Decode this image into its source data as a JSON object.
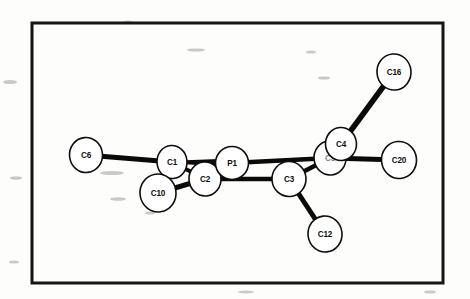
{
  "figure": {
    "kind": "molecular-structure-diagram",
    "style": "ORTEP crystal structure plot",
    "background_color": "#fdfdfc",
    "ink_color": "#0a0a0a",
    "atom_fill_color": "#ffffff",
    "frame": {
      "x": 32,
      "y": 23,
      "width": 411,
      "height": 260,
      "stroke_width": 3
    },
    "atoms": [
      {
        "id": "C6",
        "label": "C6",
        "cx": 86,
        "cy": 155,
        "rx": 16.5,
        "ry": 17.5,
        "rot": -6,
        "obscured": false
      },
      {
        "id": "C1",
        "label": "C1",
        "cx": 172,
        "cy": 162,
        "rx": 15.0,
        "ry": 16.5,
        "rot": -4,
        "obscured": false
      },
      {
        "id": "C10",
        "label": "C10",
        "cx": 158,
        "cy": 193,
        "rx": 18.0,
        "ry": 19.0,
        "rot": -8,
        "obscured": false
      },
      {
        "id": "C2",
        "label": "C2",
        "cx": 205,
        "cy": 179,
        "rx": 16.0,
        "ry": 17.0,
        "rot": -5,
        "obscured": false
      },
      {
        "id": "P1",
        "label": "P1",
        "cx": 232,
        "cy": 163,
        "rx": 16.5,
        "ry": 16.5,
        "rot": 0,
        "obscured": false
      },
      {
        "id": "C3",
        "label": "C3",
        "cx": 289,
        "cy": 179,
        "rx": 17.0,
        "ry": 17.5,
        "rot": -4,
        "obscured": false
      },
      {
        "id": "C12",
        "label": "C12",
        "cx": 325,
        "cy": 234,
        "rx": 17.0,
        "ry": 18.0,
        "rot": -6,
        "obscured": false
      },
      {
        "id": "C5",
        "label": "C5",
        "cx": 330,
        "cy": 158,
        "rx": 16.0,
        "ry": 17.0,
        "rot": -5,
        "obscured": true
      },
      {
        "id": "C4",
        "label": "C4",
        "cx": 341,
        "cy": 144,
        "rx": 15.5,
        "ry": 16.5,
        "rot": -4,
        "obscured": false
      },
      {
        "id": "C16",
        "label": "C16",
        "cx": 394,
        "cy": 72,
        "rx": 17.0,
        "ry": 18.0,
        "rot": -5,
        "obscured": false
      },
      {
        "id": "C20",
        "label": "C20",
        "cx": 399,
        "cy": 160,
        "rx": 17.5,
        "ry": 18.5,
        "rot": -5,
        "obscured": false
      }
    ],
    "bonds": [
      {
        "from": "C6",
        "to": "C1",
        "width": 5.0,
        "type": "plain"
      },
      {
        "from": "C1",
        "to": "P1",
        "width": 4.5,
        "type": "wedge"
      },
      {
        "from": "C1",
        "to": "C2",
        "width": 4.0,
        "type": "plain"
      },
      {
        "from": "C10",
        "to": "C2",
        "width": 5.0,
        "type": "plain"
      },
      {
        "from": "C2",
        "to": "C3",
        "width": 4.5,
        "type": "plain"
      },
      {
        "from": "P1",
        "to": "C5",
        "width": 4.5,
        "type": "plain"
      },
      {
        "from": "C3",
        "to": "C5",
        "width": 4.5,
        "type": "plain"
      },
      {
        "from": "C3",
        "to": "C12",
        "width": 5.0,
        "type": "plain"
      },
      {
        "from": "C4",
        "to": "C16",
        "width": 5.5,
        "type": "plain"
      },
      {
        "from": "C5",
        "to": "C20",
        "width": 5.0,
        "type": "plain"
      }
    ],
    "specks": [
      {
        "cx": 10,
        "cy": 82,
        "rx": 7,
        "ry": 2.0
      },
      {
        "cx": 16,
        "cy": 178,
        "rx": 6,
        "ry": 1.8
      },
      {
        "cx": 14,
        "cy": 262,
        "rx": 5,
        "ry": 1.6
      },
      {
        "cx": 128,
        "cy": 22,
        "rx": 4,
        "ry": 1.4
      },
      {
        "cx": 196,
        "cy": 50,
        "rx": 9,
        "ry": 1.6
      },
      {
        "cx": 311,
        "cy": 52,
        "rx": 5,
        "ry": 1.5
      },
      {
        "cx": 324,
        "cy": 78,
        "rx": 6,
        "ry": 1.6
      },
      {
        "cx": 112,
        "cy": 173,
        "rx": 12,
        "ry": 2.0
      },
      {
        "cx": 118,
        "cy": 199,
        "rx": 8,
        "ry": 1.8
      },
      {
        "cx": 150,
        "cy": 213,
        "rx": 5,
        "ry": 1.6
      },
      {
        "cx": 430,
        "cy": 292,
        "rx": 6,
        "ry": 1.6
      },
      {
        "cx": 246,
        "cy": 292,
        "rx": 8,
        "ry": 1.5
      }
    ]
  }
}
